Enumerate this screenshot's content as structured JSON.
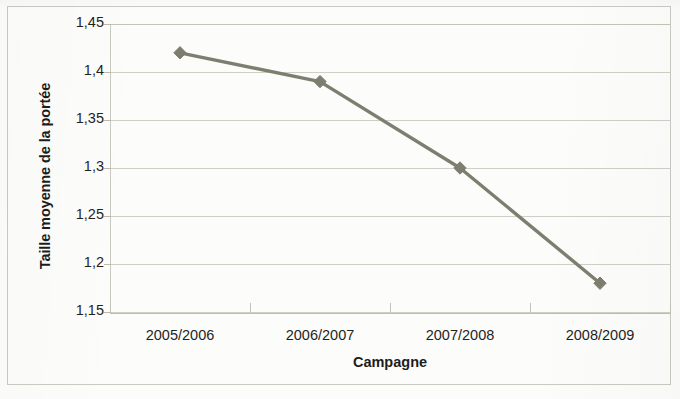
{
  "chart_data": {
    "type": "line",
    "title": "",
    "xlabel": "Campagne",
    "ylabel": "Taille moyenne de la portée",
    "categories": [
      "2005/2006",
      "2006/2007",
      "2007/2008",
      "2008/2009"
    ],
    "values": [
      1.42,
      1.39,
      1.3,
      1.18
    ],
    "series": [
      {
        "name": "Taille moyenne de la portée",
        "values": [
          1.42,
          1.39,
          1.3,
          1.18
        ]
      }
    ],
    "ylim": [
      1.15,
      1.45
    ],
    "ytick_values": [
      1.45,
      1.4,
      1.35,
      1.3,
      1.25,
      1.2,
      1.15
    ],
    "ytick_labels": [
      "1,45",
      "1,4",
      "1,35",
      "1,3",
      "1,25",
      "1,2",
      "1,15"
    ],
    "grid": "horizontal",
    "legend": "none",
    "marker": "diamond",
    "line_color": "#7e7e70",
    "marker_color": "#7e7e70",
    "gridline_color": "#cfcfc6",
    "decimal_separator": ","
  },
  "axes": {
    "y_title": "Taille moyenne de la portée",
    "x_title": "Campagne",
    "y_ticks": [
      {
        "label": "1,45",
        "value": 1.45
      },
      {
        "label": "1,4",
        "value": 1.4
      },
      {
        "label": "1,35",
        "value": 1.35
      },
      {
        "label": "1,3",
        "value": 1.3
      },
      {
        "label": "1,25",
        "value": 1.25
      },
      {
        "label": "1,2",
        "value": 1.2
      },
      {
        "label": "1,15",
        "value": 1.15
      }
    ],
    "x_ticks": [
      {
        "label": "2005/2006"
      },
      {
        "label": "2006/2007"
      },
      {
        "label": "2007/2008"
      },
      {
        "label": "2008/2009"
      }
    ]
  }
}
